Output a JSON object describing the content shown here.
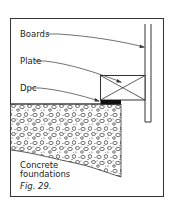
{
  "figure": {
    "caption": "Fig. 29.",
    "labels": {
      "boards": "Boards",
      "plate": "Plate",
      "dpc": "Dpc",
      "concrete_line1": "Concrete",
      "concrete_line2": "foundations"
    }
  },
  "colors": {
    "line": "#333333",
    "background": "#ffffff",
    "dpc": "#111111"
  }
}
